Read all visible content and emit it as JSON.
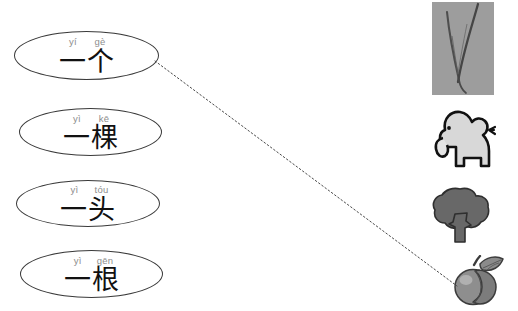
{
  "worksheet": {
    "title": "Chinese measure word matching exercise",
    "width": 518,
    "height": 311,
    "background": "#ffffff"
  },
  "colors": {
    "oval_stroke": "#3a3a3a",
    "pinyin": "#8d8d8d",
    "hanzi": "#111111",
    "photo_background": "#9d9d9d",
    "grass_stroke": "#4b4b4b",
    "elephant_fill": "#d8d8d8",
    "elephant_stroke": "#111111",
    "tree_fill": "#686868",
    "tree_stroke": "#2e2e2e",
    "peach_fill": "#8e8e8e",
    "peach_highlight": "#b4b4b4",
    "peach_stroke": "#3c3c3c",
    "connector": "#4a4a4a"
  },
  "terms": [
    {
      "id": "yi-ge",
      "pinyin_syllables": [
        "yí",
        "gè"
      ],
      "pinyin": "yí gè",
      "hanzi": "一个",
      "x": 14,
      "y": 31,
      "width": 145,
      "height": 49
    },
    {
      "id": "yi-ke",
      "pinyin_syllables": [
        "yì",
        "kē"
      ],
      "pinyin": "yì kē",
      "hanzi": "一棵",
      "x": 19,
      "y": 108,
      "width": 143,
      "height": 48
    },
    {
      "id": "yi-tou",
      "pinyin_syllables": [
        "yì",
        "tóu"
      ],
      "pinyin": "yì tóu",
      "hanzi": "一头",
      "x": 16,
      "y": 180,
      "width": 144,
      "height": 47
    },
    {
      "id": "yi-gen",
      "pinyin_syllables": [
        "yì",
        "gēn"
      ],
      "pinyin": "yì gēn",
      "hanzi": "一根",
      "x": 20,
      "y": 250,
      "width": 143,
      "height": 48
    }
  ],
  "pictures": [
    {
      "id": "grass",
      "name": "grass-blade-photo",
      "label": "blade of grass",
      "x": 432,
      "y": 2,
      "width": 62,
      "height": 93
    },
    {
      "id": "elephant",
      "name": "elephant-illustration",
      "label": "elephant",
      "x": 421,
      "y": 108,
      "width": 75,
      "height": 62
    },
    {
      "id": "tree",
      "name": "tree-illustration",
      "label": "tree",
      "x": 429,
      "y": 187,
      "width": 62,
      "height": 57
    },
    {
      "id": "peach",
      "name": "peach-illustration",
      "label": "peach",
      "x": 450,
      "y": 255,
      "width": 58,
      "height": 52
    }
  ],
  "connections": [
    {
      "id": "ge-to-peach",
      "from": "yi-ge",
      "to": "peach",
      "x1": 155,
      "y1": 61,
      "x2": 457,
      "y2": 286,
      "style": "dotted"
    }
  ]
}
